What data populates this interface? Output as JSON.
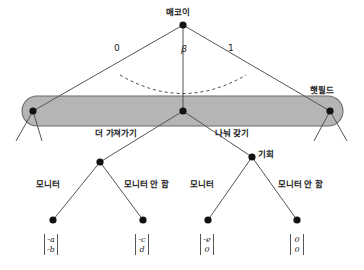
{
  "figure": {
    "type": "game-tree-diagram",
    "background_color": "#ffffff",
    "line_color": "#555555",
    "node_color": "#111111",
    "infoset_fill": "#b5b5b5",
    "infoset_stroke": "#6b6b6b"
  },
  "nodes": {
    "root_label": "매코이",
    "infoset_right_label": "햇필드",
    "chance_label": "기회"
  },
  "branches": {
    "root_left": "0",
    "root_middle": "β",
    "root_right": "1",
    "take_more": "더 가져가기",
    "share": "나눠 갖기",
    "monitor_1": "모니터",
    "no_monitor_1": "모니터 안 함",
    "monitor_2": "모니터",
    "no_monitor_2": "모니터 안 함"
  },
  "payoffs": [
    {
      "name": "payoff-1",
      "top": "-a",
      "bottom": "-b"
    },
    {
      "name": "payoff-2",
      "top": "-c",
      "bottom": "d"
    },
    {
      "name": "payoff-3",
      "top": "-e",
      "bottom": "0"
    },
    {
      "name": "payoff-4",
      "top": "0",
      "bottom": "0"
    }
  ]
}
